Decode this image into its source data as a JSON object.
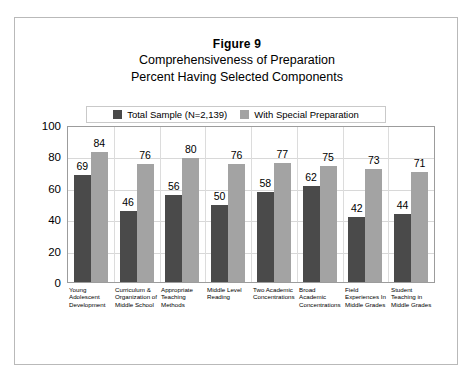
{
  "figure": {
    "title": "Figure 9",
    "subtitle_line1": "Comprehensiveness of Preparation",
    "subtitle_line2": "Percent Having Selected Components"
  },
  "legend": {
    "position": "top-center",
    "items": [
      {
        "label": "Total Sample  (N=2,139)",
        "color": "#4a4a4a"
      },
      {
        "label": "With Special Preparation",
        "color": "#a3a3a3"
      }
    ]
  },
  "axis": {
    "y_ticks": [
      "100",
      "80",
      "60",
      "40",
      "20",
      "0"
    ]
  },
  "chart_data": {
    "type": "bar",
    "xlabel": "",
    "ylabel": "",
    "ylim": [
      0,
      100
    ],
    "ytick_step": 20,
    "grid": true,
    "legend_position": "top-center",
    "categories": [
      "Young Adolescent Development",
      "Curriculum & Organization of Middle School",
      "Appropriate Teaching Methods",
      "Middle Level Reading",
      "Two Academic Concentrations",
      "Broad Academic Concentrations",
      "Field Experiences In Middle Grades",
      "Student Teaching in Middle Grades"
    ],
    "series": [
      {
        "name": "Total Sample  (N=2,139)",
        "color": "#4a4a4a",
        "values": [
          69,
          46,
          56,
          50,
          58,
          62,
          42,
          44
        ]
      },
      {
        "name": "With Special Preparation",
        "color": "#a3a3a3",
        "values": [
          84,
          76,
          80,
          76,
          77,
          75,
          73,
          71
        ]
      }
    ]
  }
}
